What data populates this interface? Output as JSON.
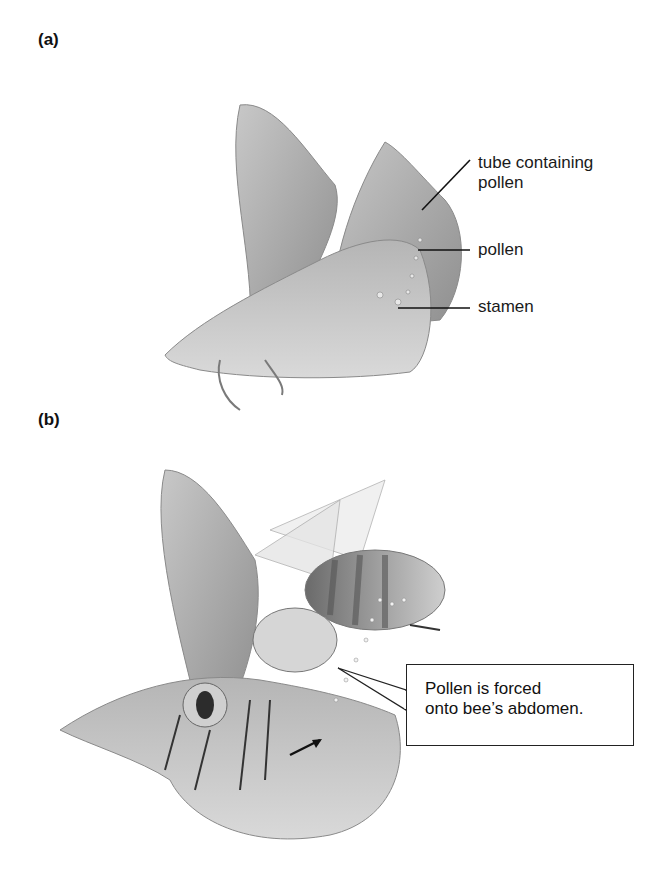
{
  "panels": [
    {
      "id": "a",
      "label": "(a)",
      "annotations": [
        {
          "name": "tube-containing-pollen",
          "lines": [
            "tube containing",
            "pollen"
          ]
        },
        {
          "name": "pollen",
          "text": "pollen"
        },
        {
          "name": "stamen",
          "text": "stamen"
        }
      ]
    },
    {
      "id": "b",
      "label": "(b)",
      "callout": {
        "lines": [
          "Pollen is forced",
          "onto bee’s abdomen."
        ]
      }
    }
  ],
  "colors": {
    "illustration_gray": "#9a9a9a",
    "line": "#111111",
    "background": "#ffffff"
  }
}
